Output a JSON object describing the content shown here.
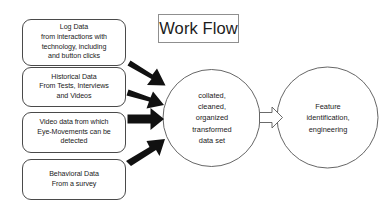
{
  "diagram": {
    "title": "Work Flow",
    "sources": [
      {
        "name": "log-data",
        "lines": [
          "Log Data",
          "from interactions with",
          "technology, including",
          "and button clicks"
        ]
      },
      {
        "name": "historical-data",
        "lines": [
          "Historical Data",
          "From Tests, Interviews",
          "and Videos"
        ]
      },
      {
        "name": "video-data",
        "lines": [
          "Video data from which",
          "Eye-Movements can be",
          "detected"
        ]
      },
      {
        "name": "behavioral-data",
        "lines": [
          "Behavioral Data",
          "From a survey"
        ]
      }
    ],
    "stages": [
      {
        "name": "dataset",
        "lines": [
          "collated,",
          "cleaned,",
          "organized",
          "transformed",
          "data set"
        ]
      },
      {
        "name": "feature",
        "lines": [
          "Feature",
          "identification,",
          "engineering"
        ]
      }
    ],
    "arrows": {
      "inbound_count": 4,
      "inbound_style": "solid-black-block-arrow",
      "connector_style": "hollow-outline-block-arrow"
    },
    "colors": {
      "arrow_fill": "#111111",
      "shape_stroke": "#4a4a4a",
      "circle_stroke": "#555555",
      "title_stroke": "#8f8f8f",
      "text": "#1a1a1a",
      "background": "#ffffff"
    }
  }
}
